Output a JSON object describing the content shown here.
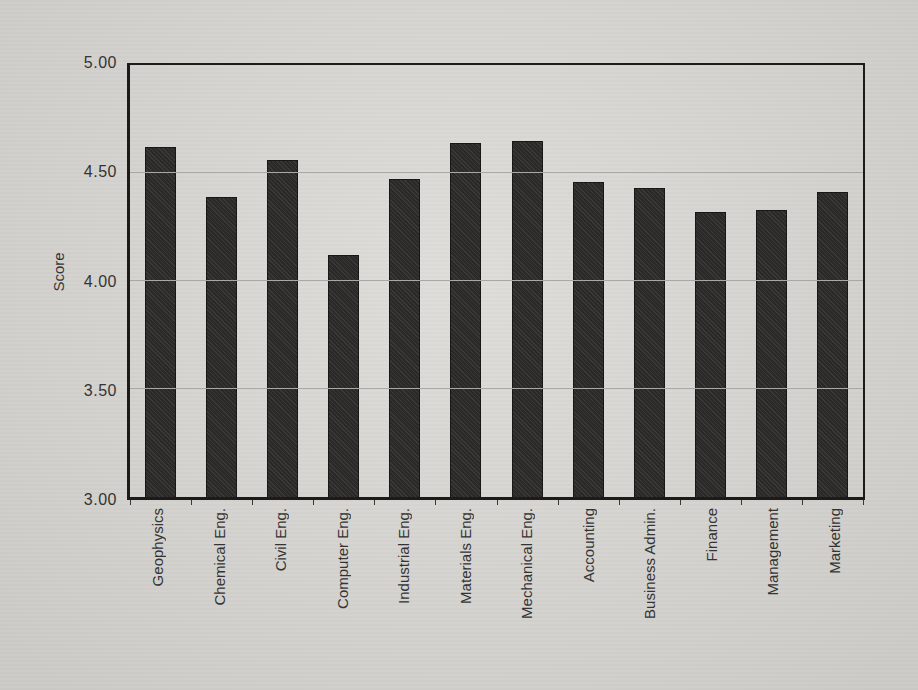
{
  "chart_data": {
    "type": "bar",
    "title": "",
    "xlabel": "",
    "ylabel": "Score",
    "categories": [
      "Geophysics",
      "Chemical Eng.",
      "Civil Eng.",
      "Computer Eng.",
      "Industrial Eng.",
      "Materials  Eng.",
      "Mechanical Eng.",
      "Accounting",
      "Business Admin.",
      "Finance",
      "Management",
      "Marketing"
    ],
    "values": [
      4.62,
      4.39,
      4.56,
      4.12,
      4.47,
      4.64,
      4.65,
      4.46,
      4.43,
      4.32,
      4.33,
      4.41
    ],
    "ylim": [
      3.0,
      5.0
    ],
    "ytick_values": [
      5.0,
      4.5,
      4.0,
      3.5,
      3.0
    ],
    "ytick_labels": [
      "5.00",
      "4.50",
      "4.00",
      "3.50",
      "3.00"
    ],
    "gridlines_at": [
      4.5,
      4.0,
      3.5
    ],
    "grid": true,
    "legend_position": "none",
    "colors": {
      "bar_fill": "#2e2d2b",
      "bar_border": "#181715",
      "background": "#d8d6d2",
      "gridline": "#a9a8a4",
      "axis": "#1c1b19",
      "text": "#343434"
    }
  }
}
